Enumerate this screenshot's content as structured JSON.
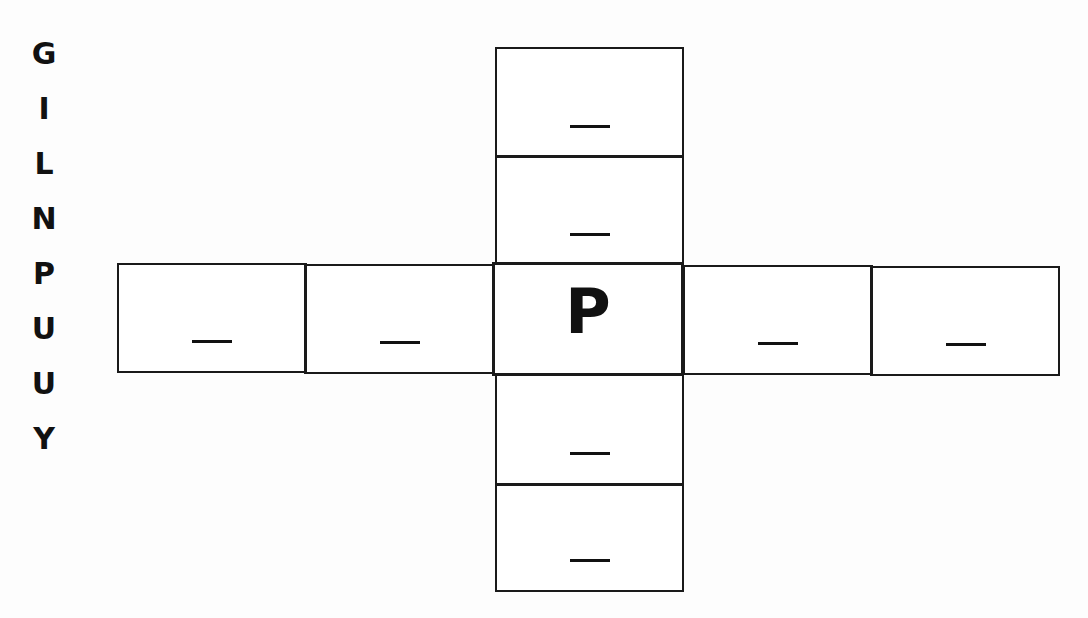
{
  "letter_bank": [
    "G",
    "I",
    "L",
    "N",
    "P",
    "U",
    "U",
    "Y"
  ],
  "grid": {
    "center": "P",
    "vertical": [
      "_",
      "_",
      "P",
      "_",
      "_"
    ],
    "horizontal": [
      "_",
      "_",
      "P",
      "_",
      "_"
    ]
  }
}
